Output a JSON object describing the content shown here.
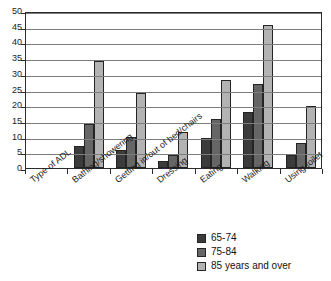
{
  "chart_data": {
    "type": "bar",
    "title": "",
    "xlabel": "Type of ADL",
    "ylabel": "",
    "ylim": [
      0,
      50
    ],
    "ytick_step": 5,
    "grid": true,
    "legend_position": "bottom-right",
    "categories": [
      "Type of ADL",
      "Bathing/showering",
      "Getting in/out of bed/chairs",
      "Dressing",
      "Eating",
      "Walking",
      "Using toilet"
    ],
    "ytick_labels": [
      "0",
      "5",
      "10",
      "15",
      "20",
      "25",
      "30",
      "35",
      "40",
      "45",
      "50"
    ],
    "series": [
      {
        "name": "65-74",
        "color": "#3b3b3b",
        "values": [
          null,
          7.0,
          5.6,
          2.2,
          9.6,
          17.9,
          4.1
        ]
      },
      {
        "name": "75-84",
        "color": "#666666",
        "values": [
          null,
          13.9,
          9.9,
          4.2,
          15.5,
          26.6,
          8.0
        ]
      },
      {
        "name": "85 years and over",
        "color": "#b3b3b3",
        "values": [
          null,
          34.1,
          24.0,
          11.4,
          28.1,
          45.7,
          19.7
        ]
      }
    ]
  },
  "legend": {
    "items": [
      {
        "label": "65-74"
      },
      {
        "label": "75-84"
      },
      {
        "label": "85 years and over"
      }
    ]
  }
}
